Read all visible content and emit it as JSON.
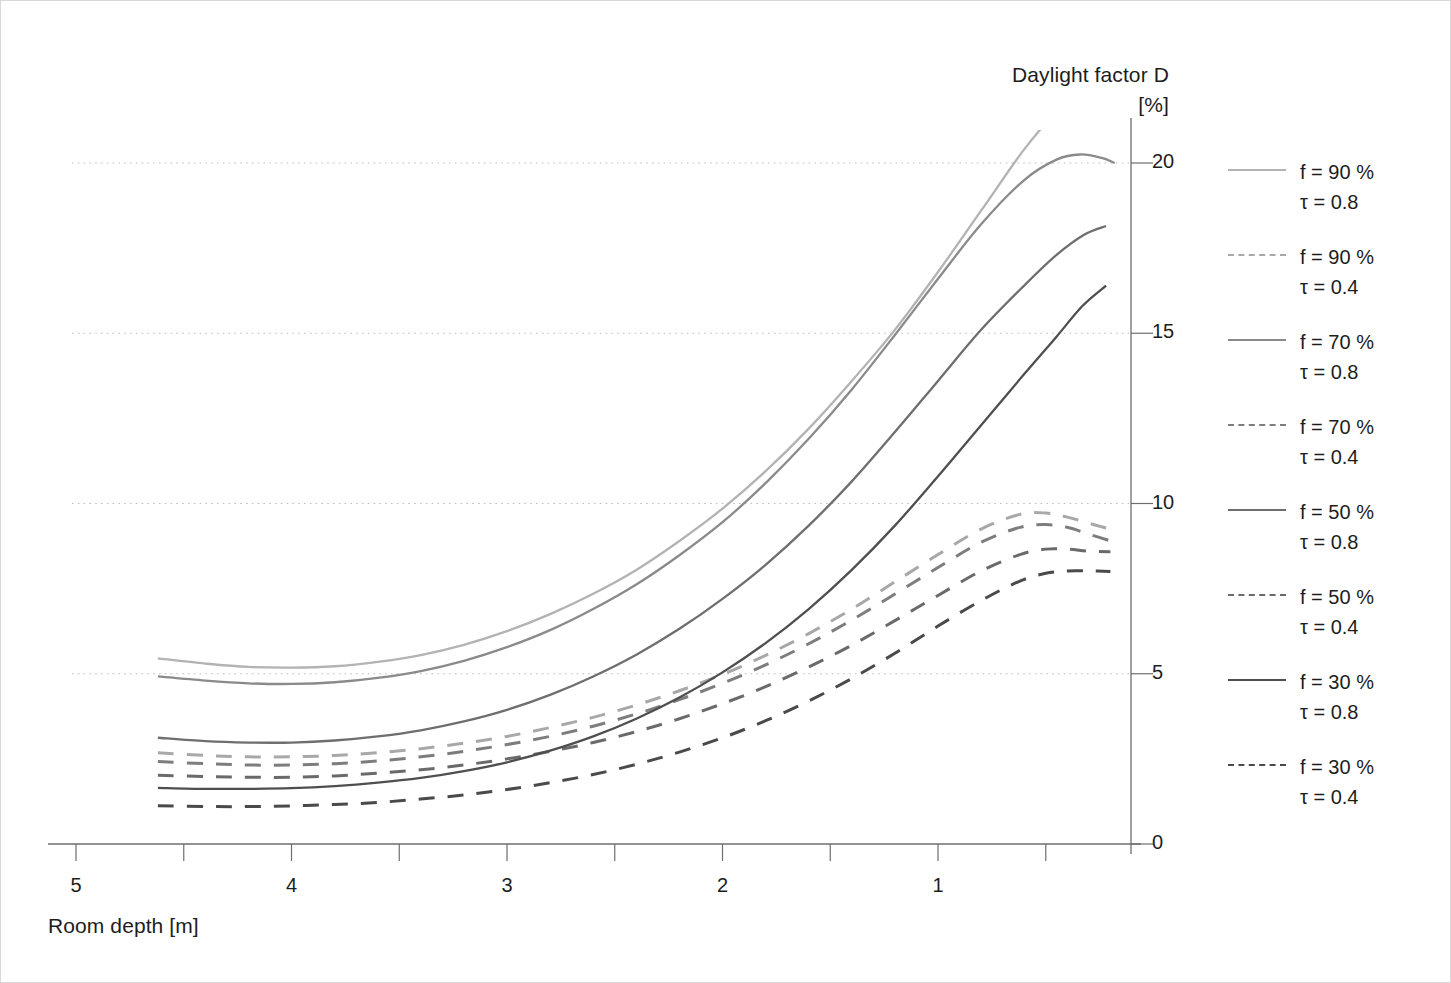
{
  "chart_data": {
    "type": "line",
    "title": "",
    "xlabel": "Room depth [m]",
    "ylabel": "Daylight factor D",
    "yunit": "[%]",
    "xlim": [
      5.35,
      0.15
    ],
    "ylim": [
      0,
      22
    ],
    "x_ticks": [
      5,
      4.5,
      4,
      3.5,
      3,
      2.5,
      2,
      1.5,
      1,
      0.5
    ],
    "x_tick_labels": [
      "5",
      "",
      "4",
      "",
      "3",
      "",
      "2",
      "",
      "1",
      ""
    ],
    "y_ticks": [
      0,
      5,
      10,
      15,
      20
    ],
    "y_tick_labels": [
      "0",
      "5",
      "10",
      "15",
      "20"
    ],
    "grid": "horizontal-dotted",
    "grid_values": [
      5,
      10,
      15,
      20
    ],
    "legend_position": "right",
    "x_axis_direction": "decreasing",
    "series": [
      {
        "name": "f = 90 % / τ = 0.8",
        "f": "90 %",
        "tau": "0.8",
        "style": "solid",
        "color": "#b3b3b3",
        "x": [
          4.62,
          4.4,
          4.2,
          4.0,
          3.8,
          3.6,
          3.4,
          3.2,
          3.0,
          2.8,
          2.6,
          2.4,
          2.2,
          2.0,
          1.8,
          1.6,
          1.4,
          1.2,
          1.0,
          0.8,
          0.6,
          0.45,
          0.35,
          0.28
        ],
        "y": [
          5.45,
          5.3,
          5.2,
          5.18,
          5.22,
          5.35,
          5.55,
          5.85,
          6.25,
          6.75,
          7.35,
          8.05,
          8.9,
          9.85,
          10.95,
          12.2,
          13.6,
          15.1,
          16.8,
          18.6,
          20.4,
          21.5,
          22.0,
          22.3
        ]
      },
      {
        "name": "f = 90 % / τ = 0.4",
        "f": "90 %",
        "tau": "0.4",
        "style": "dashed",
        "color": "#a8a8a8",
        "x": [
          4.62,
          4.4,
          4.2,
          4.0,
          3.8,
          3.6,
          3.4,
          3.2,
          3.0,
          2.8,
          2.6,
          2.4,
          2.2,
          2.0,
          1.8,
          1.6,
          1.4,
          1.2,
          1.0,
          0.8,
          0.62,
          0.5,
          0.4,
          0.3,
          0.22
        ],
        "y": [
          2.68,
          2.6,
          2.56,
          2.56,
          2.6,
          2.68,
          2.8,
          2.96,
          3.16,
          3.42,
          3.72,
          4.08,
          4.5,
          4.98,
          5.54,
          6.18,
          6.9,
          7.7,
          8.5,
          9.25,
          9.68,
          9.72,
          9.6,
          9.42,
          9.28
        ]
      },
      {
        "name": "f = 70 % / τ = 0.8",
        "f": "70 %",
        "tau": "0.8",
        "style": "solid",
        "color": "#8a8a8a",
        "x": [
          4.62,
          4.4,
          4.2,
          4.0,
          3.8,
          3.6,
          3.4,
          3.2,
          3.0,
          2.8,
          2.6,
          2.4,
          2.2,
          2.0,
          1.8,
          1.6,
          1.4,
          1.2,
          1.0,
          0.8,
          0.6,
          0.45,
          0.34,
          0.24,
          0.18
        ],
        "y": [
          4.92,
          4.8,
          4.72,
          4.7,
          4.75,
          4.88,
          5.08,
          5.38,
          5.78,
          6.28,
          6.9,
          7.62,
          8.48,
          9.45,
          10.6,
          11.9,
          13.35,
          14.95,
          16.6,
          18.2,
          19.5,
          20.1,
          20.25,
          20.15,
          20.0
        ]
      },
      {
        "name": "f = 70 % / τ = 0.4",
        "f": "70 %",
        "tau": "0.4",
        "style": "dashed",
        "color": "#7d7d7d",
        "x": [
          4.62,
          4.4,
          4.2,
          4.0,
          3.8,
          3.6,
          3.4,
          3.2,
          3.0,
          2.8,
          2.6,
          2.4,
          2.2,
          2.0,
          1.8,
          1.6,
          1.4,
          1.2,
          1.0,
          0.8,
          0.62,
          0.5,
          0.4,
          0.3,
          0.2
        ],
        "y": [
          2.42,
          2.36,
          2.32,
          2.32,
          2.36,
          2.44,
          2.56,
          2.72,
          2.92,
          3.16,
          3.46,
          3.82,
          4.24,
          4.72,
          5.26,
          5.88,
          6.58,
          7.34,
          8.12,
          8.86,
          9.3,
          9.38,
          9.3,
          9.1,
          8.9
        ]
      },
      {
        "name": "f = 50 % / τ = 0.8",
        "f": "50 %",
        "tau": "0.8",
        "style": "solid",
        "color": "#6e6e6e",
        "x": [
          4.62,
          4.4,
          4.2,
          4.0,
          3.8,
          3.6,
          3.4,
          3.2,
          3.0,
          2.8,
          2.6,
          2.4,
          2.2,
          2.0,
          1.8,
          1.6,
          1.4,
          1.2,
          1.0,
          0.8,
          0.6,
          0.45,
          0.32,
          0.22
        ],
        "y": [
          3.12,
          3.02,
          2.98,
          2.98,
          3.04,
          3.16,
          3.34,
          3.6,
          3.94,
          4.38,
          4.92,
          5.56,
          6.32,
          7.2,
          8.2,
          9.35,
          10.65,
          12.1,
          13.6,
          15.1,
          16.4,
          17.3,
          17.9,
          18.15
        ]
      },
      {
        "name": "f = 50 % / τ = 0.4",
        "f": "50 %",
        "tau": "0.4",
        "style": "dashed",
        "color": "#6a6a6a",
        "x": [
          4.62,
          4.4,
          4.2,
          4.0,
          3.8,
          3.6,
          3.4,
          3.2,
          3.0,
          2.8,
          2.6,
          2.4,
          2.2,
          2.0,
          1.8,
          1.6,
          1.4,
          1.2,
          1.0,
          0.8,
          0.62,
          0.5,
          0.4,
          0.3,
          0.2
        ],
        "y": [
          2.02,
          1.98,
          1.96,
          1.96,
          2.0,
          2.08,
          2.18,
          2.32,
          2.5,
          2.72,
          2.98,
          3.3,
          3.68,
          4.12,
          4.62,
          5.2,
          5.84,
          6.56,
          7.3,
          8.02,
          8.5,
          8.66,
          8.66,
          8.6,
          8.58
        ]
      },
      {
        "name": "f = 30 % / τ = 0.8",
        "f": "30 %",
        "tau": "0.8",
        "style": "solid",
        "color": "#4f4f4f",
        "x": [
          4.62,
          4.4,
          4.2,
          4.0,
          3.8,
          3.6,
          3.4,
          3.2,
          3.0,
          2.8,
          2.6,
          2.4,
          2.2,
          2.0,
          1.8,
          1.6,
          1.4,
          1.2,
          1.0,
          0.8,
          0.6,
          0.45,
          0.33,
          0.22
        ],
        "y": [
          1.65,
          1.62,
          1.62,
          1.64,
          1.7,
          1.8,
          1.94,
          2.14,
          2.4,
          2.74,
          3.16,
          3.68,
          4.3,
          5.04,
          5.9,
          6.9,
          8.05,
          9.35,
          10.8,
          12.3,
          13.8,
          14.9,
          15.8,
          16.4
        ]
      },
      {
        "name": "f = 30 % / τ = 0.4",
        "f": "30 %",
        "tau": "0.4",
        "style": "dashed",
        "color": "#4a4a4a",
        "x": [
          4.62,
          4.4,
          4.2,
          4.0,
          3.8,
          3.6,
          3.4,
          3.2,
          3.0,
          2.8,
          2.6,
          2.4,
          2.2,
          2.0,
          1.8,
          1.6,
          1.4,
          1.2,
          1.0,
          0.8,
          0.62,
          0.5,
          0.4,
          0.3,
          0.2
        ],
        "y": [
          1.12,
          1.1,
          1.1,
          1.12,
          1.16,
          1.22,
          1.32,
          1.44,
          1.6,
          1.8,
          2.04,
          2.34,
          2.7,
          3.12,
          3.62,
          4.2,
          4.86,
          5.6,
          6.4,
          7.15,
          7.72,
          7.95,
          8.02,
          8.02,
          8.0
        ]
      }
    ]
  },
  "axes": {
    "y_title_main": "Daylight factor D",
    "y_title_unit": "[%]",
    "x_title": "Room depth [m]"
  },
  "y_ticks": [
    {
      "label": "20",
      "value": 20
    },
    {
      "label": "15",
      "value": 15
    },
    {
      "label": "10",
      "value": 10
    },
    {
      "label": "5",
      "value": 5
    },
    {
      "label": "0",
      "value": 0
    }
  ],
  "x_ticks": [
    {
      "label": "5",
      "value": 5
    },
    {
      "label": "4",
      "value": 4
    },
    {
      "label": "3",
      "value": 3
    },
    {
      "label": "2",
      "value": 2
    },
    {
      "label": "1",
      "value": 1
    }
  ],
  "legend": {
    "items": [
      {
        "line1": "f = 90 %",
        "line2": "τ = 0.8",
        "style": "solid",
        "color": "#b3b3b3"
      },
      {
        "line1": "f = 90 %",
        "line2": "τ = 0.4",
        "style": "dashed",
        "color": "#a8a8a8"
      },
      {
        "line1": "f = 70 %",
        "line2": "τ = 0.8",
        "style": "solid",
        "color": "#8a8a8a"
      },
      {
        "line1": "f = 70 %",
        "line2": "τ = 0.4",
        "style": "dashed",
        "color": "#7d7d7d"
      },
      {
        "line1": "f = 50 %",
        "line2": "τ = 0.8",
        "style": "solid",
        "color": "#6e6e6e"
      },
      {
        "line1": "f = 50 %",
        "line2": "τ = 0.4",
        "style": "dashed",
        "color": "#6a6a6a"
      },
      {
        "line1": "f = 30 %",
        "line2": "τ = 0.8",
        "style": "solid",
        "color": "#4f4f4f"
      },
      {
        "line1": "f = 30 %",
        "line2": "τ = 0.4",
        "style": "dashed",
        "color": "#4a4a4a"
      }
    ]
  },
  "colors": {
    "axis": "#6e6e6e",
    "grid": "#bdbdbd",
    "frame": "#d8d8d8",
    "text": "#1d1d1d"
  }
}
